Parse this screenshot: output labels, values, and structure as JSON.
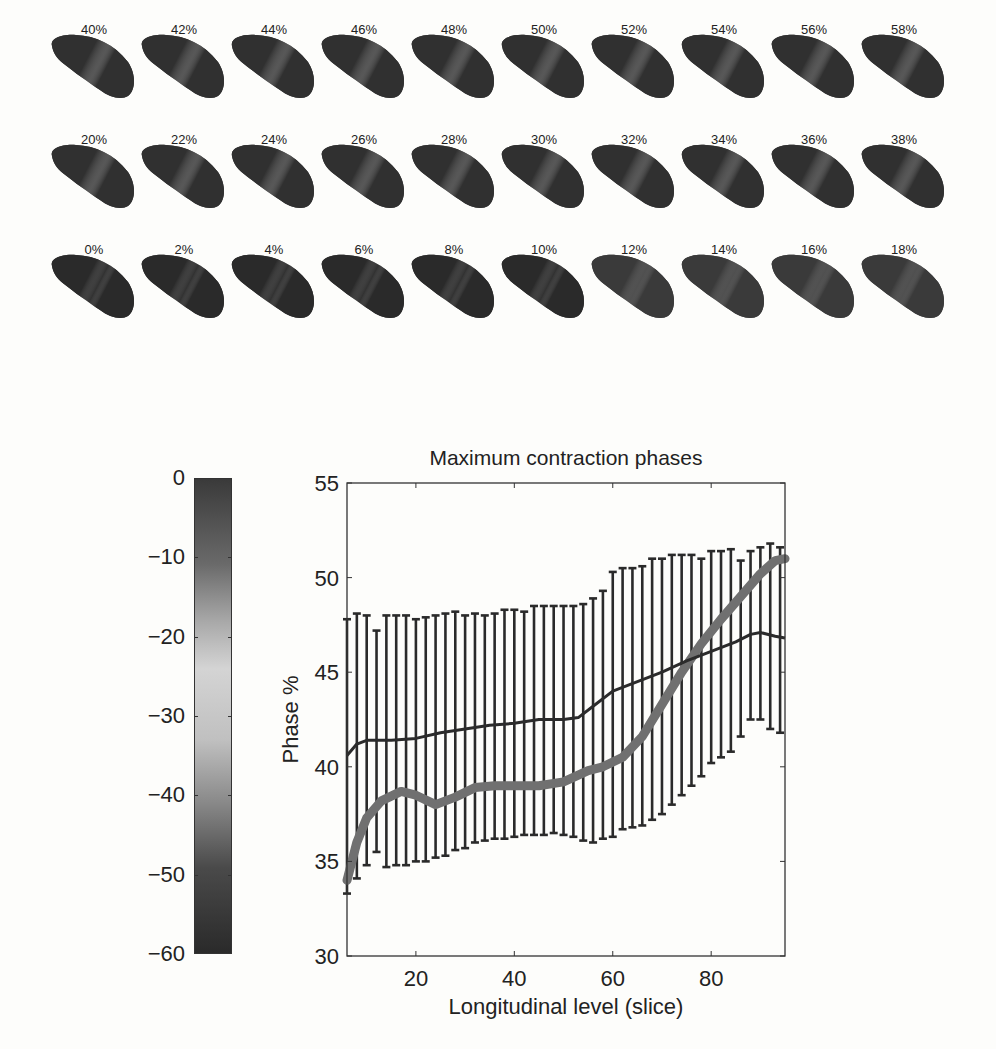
{
  "thumbnails": {
    "rows": [
      [
        "40%",
        "42%",
        "44%",
        "46%",
        "48%",
        "50%",
        "52%",
        "54%",
        "56%",
        "58%"
      ],
      [
        "20%",
        "22%",
        "24%",
        "26%",
        "28%",
        "30%",
        "32%",
        "34%",
        "36%",
        "38%"
      ],
      [
        "0%",
        "2%",
        "4%",
        "6%",
        "8%",
        "10%",
        "12%",
        "14%",
        "16%",
        "18%"
      ]
    ]
  },
  "colorbar": {
    "ticks": [
      "0",
      "−10",
      "−20",
      "−30",
      "−40",
      "−50",
      "−60"
    ],
    "range": [
      -60,
      0
    ],
    "colors": {
      "top": "#3a3a3a",
      "mid": "#d4d4d4",
      "bottom": "#2a2a2a"
    }
  },
  "chart_data": {
    "type": "line",
    "title": "Maximum contraction phases",
    "xlabel": "Longitudinal level (slice)",
    "ylabel": "Phase %",
    "xlim": [
      6,
      95
    ],
    "ylim": [
      30,
      55
    ],
    "xticks": [
      20,
      40,
      60,
      80
    ],
    "yticks": [
      30,
      35,
      40,
      45,
      50,
      55
    ],
    "grid": false,
    "legend": null,
    "series": [
      {
        "name": "thin dark line",
        "style": "thin dark line",
        "color": "#2b2b2b",
        "x": [
          6,
          8,
          10,
          15,
          20,
          25,
          30,
          35,
          40,
          45,
          50,
          53,
          56,
          60,
          65,
          70,
          75,
          80,
          85,
          88,
          90,
          93,
          95
        ],
        "y": [
          40.6,
          41.2,
          41.4,
          41.4,
          41.5,
          41.8,
          42.0,
          42.2,
          42.3,
          42.5,
          42.5,
          42.6,
          43.2,
          44.0,
          44.5,
          45.0,
          45.6,
          46.1,
          46.6,
          47.0,
          47.1,
          46.9,
          46.8
        ]
      },
      {
        "name": "thick gray line",
        "style": "thick gray line",
        "color": "#707070",
        "x": [
          6,
          8,
          10,
          13,
          17,
          20,
          24,
          28,
          32,
          36,
          40,
          45,
          50,
          55,
          58,
          62,
          66,
          70,
          74,
          78,
          82,
          86,
          90,
          93,
          95
        ],
        "y": [
          34.0,
          36.0,
          37.3,
          38.2,
          38.7,
          38.5,
          38.0,
          38.4,
          38.9,
          39.0,
          39.0,
          39.0,
          39.2,
          39.8,
          40.0,
          40.5,
          41.6,
          43.3,
          45.0,
          46.5,
          47.8,
          49.0,
          50.2,
          50.9,
          51.0
        ]
      }
    ],
    "error_bars": {
      "x": [
        6,
        8,
        10,
        12,
        14,
        16,
        18,
        20,
        22,
        24,
        26,
        28,
        30,
        32,
        34,
        36,
        38,
        40,
        42,
        44,
        46,
        48,
        50,
        52,
        54,
        56,
        58,
        60,
        62,
        64,
        66,
        68,
        70,
        72,
        74,
        76,
        78,
        80,
        82,
        84,
        86,
        88,
        90,
        92,
        94
      ],
      "upper": [
        47.8,
        48.1,
        48.0,
        47.2,
        48.0,
        48.0,
        48.0,
        47.8,
        47.9,
        48.0,
        48.1,
        48.2,
        48.0,
        48.1,
        48.0,
        48.1,
        48.3,
        48.3,
        48.2,
        48.5,
        48.5,
        48.5,
        48.5,
        48.5,
        48.6,
        48.9,
        49.3,
        50.3,
        50.5,
        50.5,
        50.6,
        51.0,
        51.0,
        51.2,
        51.2,
        51.2,
        51.0,
        51.4,
        51.4,
        51.5,
        50.9,
        51.4,
        51.6,
        51.8,
        51.6
      ],
      "lower": [
        33.3,
        34.1,
        34.8,
        35.5,
        34.7,
        34.8,
        34.8,
        35.0,
        35.0,
        35.2,
        35.3,
        35.6,
        35.7,
        36.0,
        36.1,
        36.2,
        36.2,
        36.3,
        36.4,
        36.4,
        36.4,
        36.5,
        36.4,
        36.3,
        36.1,
        36.0,
        36.2,
        36.3,
        36.7,
        36.8,
        36.9,
        37.2,
        37.5,
        38.0,
        38.5,
        39.0,
        39.5,
        40.2,
        40.5,
        40.8,
        41.6,
        42.5,
        42.5,
        42.0,
        41.8
      ]
    }
  }
}
